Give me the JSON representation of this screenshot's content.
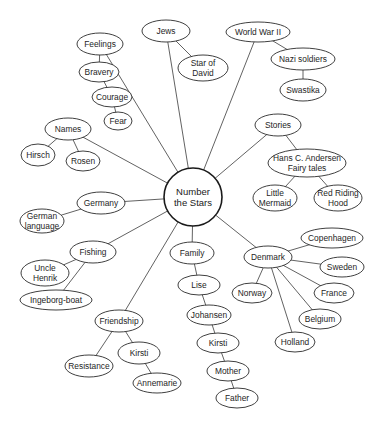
{
  "diagram": {
    "type": "concept-web",
    "center": {
      "id": "center",
      "label_lines": [
        "Number",
        "the Stars"
      ],
      "x": 193,
      "y": 197,
      "r": 29
    },
    "nodes": [
      {
        "id": "feelings",
        "label_lines": [
          "Feelings"
        ],
        "x": 100,
        "y": 44,
        "rx": 23,
        "ry": 11
      },
      {
        "id": "bravery",
        "label_lines": [
          "Bravery"
        ],
        "x": 99,
        "y": 72,
        "rx": 20,
        "ry": 10
      },
      {
        "id": "courage",
        "label_lines": [
          "Courage"
        ],
        "x": 112,
        "y": 97,
        "rx": 20,
        "ry": 10
      },
      {
        "id": "fear",
        "label_lines": [
          "Fear"
        ],
        "x": 118,
        "y": 121,
        "rx": 14,
        "ry": 9
      },
      {
        "id": "jews",
        "label_lines": [
          "Jews"
        ],
        "x": 166,
        "y": 31,
        "rx": 24,
        "ry": 11
      },
      {
        "id": "star-of-david",
        "label_lines": [
          "Star of",
          "David"
        ],
        "x": 203,
        "y": 68,
        "rx": 25,
        "ry": 13
      },
      {
        "id": "world-war-ii",
        "label_lines": [
          "World War II"
        ],
        "x": 258,
        "y": 32,
        "rx": 32,
        "ry": 10
      },
      {
        "id": "nazi-soldiers",
        "label_lines": [
          "Nazi soldiers"
        ],
        "x": 303,
        "y": 59,
        "rx": 32,
        "ry": 11
      },
      {
        "id": "swastika",
        "label_lines": [
          "Swastika"
        ],
        "x": 303,
        "y": 90,
        "rx": 23,
        "ry": 11
      },
      {
        "id": "names",
        "label_lines": [
          "Names"
        ],
        "x": 68,
        "y": 129,
        "rx": 23,
        "ry": 11
      },
      {
        "id": "hirsch",
        "label_lines": [
          "Hirsch"
        ],
        "x": 38,
        "y": 155,
        "rx": 17,
        "ry": 11
      },
      {
        "id": "rosen",
        "label_lines": [
          "Rosen"
        ],
        "x": 83,
        "y": 161,
        "rx": 17,
        "ry": 10
      },
      {
        "id": "stories",
        "label_lines": [
          "Stories"
        ],
        "x": 278,
        "y": 125,
        "rx": 23,
        "ry": 11
      },
      {
        "id": "hans-c-andersen",
        "label_lines": [
          "Hans C. Andersen",
          "Fairy tales"
        ],
        "x": 307,
        "y": 163,
        "rx": 39,
        "ry": 14
      },
      {
        "id": "little-mermaid",
        "label_lines": [
          "Little",
          "Mermaid"
        ],
        "x": 275,
        "y": 198,
        "rx": 22,
        "ry": 13
      },
      {
        "id": "red-riding-hood",
        "label_lines": [
          "Red Riding",
          "Hood"
        ],
        "x": 338,
        "y": 198,
        "rx": 24,
        "ry": 13
      },
      {
        "id": "germany",
        "label_lines": [
          "Germany"
        ],
        "x": 101,
        "y": 203,
        "rx": 24,
        "ry": 11
      },
      {
        "id": "german-language",
        "label_lines": [
          "German",
          "language"
        ],
        "x": 42,
        "y": 221,
        "rx": 22,
        "ry": 12
      },
      {
        "id": "fishing",
        "label_lines": [
          "Fishing"
        ],
        "x": 93,
        "y": 252,
        "rx": 23,
        "ry": 11
      },
      {
        "id": "uncle-henrik",
        "label_lines": [
          "Uncle",
          "Henrik"
        ],
        "x": 45,
        "y": 273,
        "rx": 24,
        "ry": 13
      },
      {
        "id": "ingeborg-boat",
        "label_lines": [
          "Ingeborg-boat"
        ],
        "x": 56,
        "y": 300,
        "rx": 36,
        "ry": 10
      },
      {
        "id": "friendship",
        "label_lines": [
          "Friendship"
        ],
        "x": 119,
        "y": 321,
        "rx": 24,
        "ry": 11
      },
      {
        "id": "resistance",
        "label_lines": [
          "Resistance"
        ],
        "x": 89,
        "y": 366,
        "rx": 24,
        "ry": 11
      },
      {
        "id": "kirsti-friend",
        "label_lines": [
          "Kirsti"
        ],
        "x": 139,
        "y": 353,
        "rx": 21,
        "ry": 11
      },
      {
        "id": "annemarie",
        "label_lines": [
          "Annemarie"
        ],
        "x": 157,
        "y": 383,
        "rx": 24,
        "ry": 10
      },
      {
        "id": "family",
        "label_lines": [
          "Family"
        ],
        "x": 192,
        "y": 253,
        "rx": 22,
        "ry": 11
      },
      {
        "id": "lise",
        "label_lines": [
          "Lise"
        ],
        "x": 199,
        "y": 285,
        "rx": 21,
        "ry": 10
      },
      {
        "id": "johansen",
        "label_lines": [
          "Johansen"
        ],
        "x": 209,
        "y": 315,
        "rx": 22,
        "ry": 10
      },
      {
        "id": "kirsti-family",
        "label_lines": [
          "Kirsti"
        ],
        "x": 218,
        "y": 343,
        "rx": 21,
        "ry": 10
      },
      {
        "id": "mother",
        "label_lines": [
          "Mother"
        ],
        "x": 228,
        "y": 371,
        "rx": 21,
        "ry": 10
      },
      {
        "id": "father",
        "label_lines": [
          "Father"
        ],
        "x": 237,
        "y": 398,
        "rx": 21,
        "ry": 10
      },
      {
        "id": "denmark",
        "label_lines": [
          "Denmark"
        ],
        "x": 268,
        "y": 257,
        "rx": 24,
        "ry": 11
      },
      {
        "id": "copenhagen",
        "label_lines": [
          "Copenhagen"
        ],
        "x": 332,
        "y": 238,
        "rx": 31,
        "ry": 10
      },
      {
        "id": "sweden",
        "label_lines": [
          "Sweden"
        ],
        "x": 342,
        "y": 267,
        "rx": 22,
        "ry": 10
      },
      {
        "id": "france",
        "label_lines": [
          "France"
        ],
        "x": 334,
        "y": 293,
        "rx": 20,
        "ry": 10
      },
      {
        "id": "norway",
        "label_lines": [
          "Norway"
        ],
        "x": 252,
        "y": 293,
        "rx": 20,
        "ry": 10
      },
      {
        "id": "belgium",
        "label_lines": [
          "Belgium"
        ],
        "x": 320,
        "y": 319,
        "rx": 21,
        "ry": 10
      },
      {
        "id": "holland",
        "label_lines": [
          "Holland"
        ],
        "x": 295,
        "y": 342,
        "rx": 20,
        "ry": 10
      }
    ],
    "edges": [
      [
        "center",
        "feelings"
      ],
      [
        "feelings",
        "bravery"
      ],
      [
        "bravery",
        "courage"
      ],
      [
        "courage",
        "fear"
      ],
      [
        "center",
        "jews"
      ],
      [
        "jews",
        "star-of-david"
      ],
      [
        "center",
        "world-war-ii"
      ],
      [
        "world-war-ii",
        "nazi-soldiers"
      ],
      [
        "nazi-soldiers",
        "swastika"
      ],
      [
        "center",
        "names"
      ],
      [
        "names",
        "hirsch"
      ],
      [
        "names",
        "rosen"
      ],
      [
        "center",
        "stories"
      ],
      [
        "stories",
        "hans-c-andersen"
      ],
      [
        "hans-c-andersen",
        "little-mermaid"
      ],
      [
        "hans-c-andersen",
        "red-riding-hood"
      ],
      [
        "center",
        "germany"
      ],
      [
        "germany",
        "german-language"
      ],
      [
        "center",
        "fishing"
      ],
      [
        "fishing",
        "uncle-henrik"
      ],
      [
        "fishing",
        "ingeborg-boat"
      ],
      [
        "center",
        "friendship"
      ],
      [
        "friendship",
        "resistance"
      ],
      [
        "friendship",
        "kirsti-friend"
      ],
      [
        "kirsti-friend",
        "annemarie"
      ],
      [
        "center",
        "family"
      ],
      [
        "family",
        "lise"
      ],
      [
        "lise",
        "johansen"
      ],
      [
        "johansen",
        "kirsti-family"
      ],
      [
        "kirsti-family",
        "mother"
      ],
      [
        "mother",
        "father"
      ],
      [
        "center",
        "denmark"
      ],
      [
        "denmark",
        "copenhagen"
      ],
      [
        "denmark",
        "sweden"
      ],
      [
        "denmark",
        "france"
      ],
      [
        "denmark",
        "norway"
      ],
      [
        "denmark",
        "belgium"
      ],
      [
        "denmark",
        "holland"
      ]
    ]
  }
}
